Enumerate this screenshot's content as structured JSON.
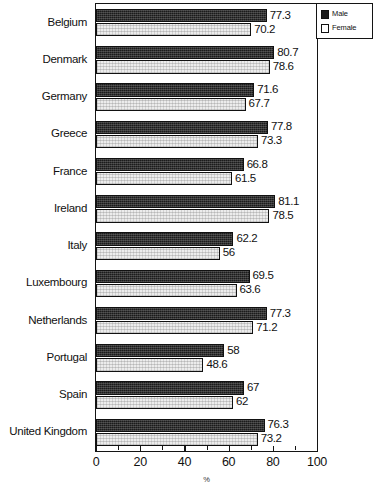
{
  "chart_data": {
    "type": "bar",
    "orientation": "horizontal",
    "title": "",
    "xlabel": "%",
    "ylabel": "",
    "xlim": [
      0,
      100
    ],
    "xticks": [
      0,
      20,
      40,
      60,
      80,
      100
    ],
    "xtick_labels": [
      "0",
      "20",
      "40",
      "60",
      "80",
      "100"
    ],
    "minor_tick_step": 10,
    "grid": false,
    "legend_position": "top-right",
    "categories": [
      "Belgium",
      "Denmark",
      "Germany",
      "Greece",
      "France",
      "Ireland",
      "Italy",
      "Luxembourg",
      "Netherlands",
      "Portugal",
      "Spain",
      "United Kingdom"
    ],
    "series": [
      {
        "name": "Male",
        "color": "#1b1b1b",
        "values": [
          77.3,
          80.7,
          71.6,
          77.8,
          66.8,
          81.1,
          62.2,
          69.5,
          77.3,
          58,
          67,
          76.3
        ],
        "labels": [
          "77.3",
          "80.7",
          "71.6",
          "77.8",
          "66.8",
          "81.1",
          "62.2",
          "69.5",
          "77.3",
          "58",
          "67",
          "76.3"
        ]
      },
      {
        "name": "Female",
        "color": "#ececec",
        "values": [
          70.2,
          78.6,
          67.7,
          73.3,
          61.5,
          78.5,
          56,
          63.6,
          71.2,
          48.6,
          62,
          73.2
        ],
        "labels": [
          "70.2",
          "78.6",
          "67.7",
          "73.3",
          "61.5",
          "78.5",
          "56",
          "63.6",
          "71.2",
          "48.6",
          "62",
          "73.2"
        ]
      }
    ]
  },
  "legend": {
    "items": [
      {
        "label": "Male"
      },
      {
        "label": "Female"
      }
    ]
  },
  "axis": {
    "x_title": "%"
  }
}
